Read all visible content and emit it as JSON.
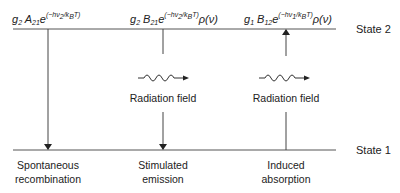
{
  "states": {
    "upper": "State 2",
    "lower": "State 1"
  },
  "transitions": [
    {
      "id": "spontaneous",
      "rate_parts": {
        "g": "g",
        "g_sub": "2",
        "coef": "A",
        "coef_sub": "21",
        "exp_base": "e",
        "exp": "(−hν",
        "exp_sub": "2",
        "exp_tail": "/k",
        "exp_sub2": "B",
        "exp_end": "T)",
        "rho": ""
      },
      "label_line1": "Spontaneous",
      "label_line2": "recombination",
      "direction": "down",
      "radiation_field": ""
    },
    {
      "id": "stimulated",
      "rate_parts": {
        "g": "g",
        "g_sub": "2",
        "coef": "B",
        "coef_sub": "21",
        "exp_base": "e",
        "exp": "(−hν",
        "exp_sub": "2",
        "exp_tail": "/k",
        "exp_sub2": "B",
        "exp_end": "T)",
        "rho": "ρ(ν)"
      },
      "label_line1": "Stimulated",
      "label_line2": "emission",
      "direction": "down",
      "radiation_field": "Radiation field"
    },
    {
      "id": "induced",
      "rate_parts": {
        "g": "g",
        "g_sub": "1",
        "coef": "B",
        "coef_sub": "12",
        "exp_base": "e",
        "exp": "(−hν",
        "exp_sub": "1",
        "exp_tail": "/k",
        "exp_sub2": "B",
        "exp_end": "T)",
        "rho": "ρ(ν)"
      },
      "label_line1": "Induced",
      "label_line2": "absorption",
      "direction": "up",
      "radiation_field": "Radiation field"
    }
  ],
  "colors": {
    "line": "#555555",
    "text": "#222222"
  }
}
